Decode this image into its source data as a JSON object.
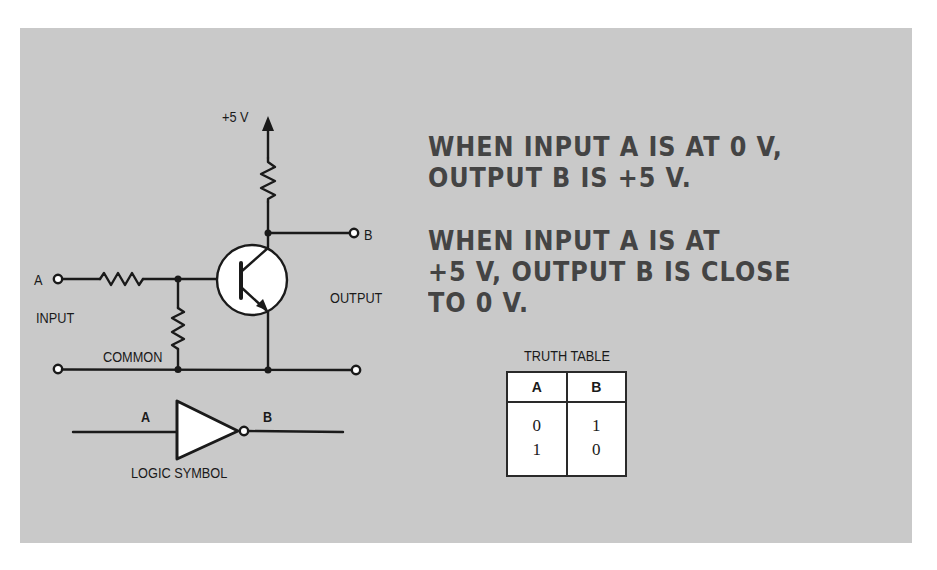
{
  "circuit": {
    "supply_label": "+5 V",
    "input_terminal_label": "A",
    "input_label": "INPUT",
    "output_terminal_label": "B",
    "output_label": "OUTPUT",
    "common_label": "COMMON"
  },
  "logic_symbol": {
    "input_label": "A",
    "output_label": "B",
    "caption": "LOGIC SYMBOL"
  },
  "notes": {
    "paragraph_1": "WHEN INPUT A IS AT 0 V,\nOUTPUT B IS +5 V.",
    "paragraph_2": "WHEN INPUT A IS AT\n+5 V, OUTPUT B IS CLOSE\nTO 0 V."
  },
  "truth_table": {
    "title": "TRUTH TABLE",
    "headers": [
      "A",
      "B"
    ],
    "rows": [
      [
        "0",
        "1"
      ],
      [
        "1",
        "0"
      ]
    ]
  },
  "colors": {
    "panel_bg": "#c9c9c9",
    "ink": "#1a1a1a",
    "handwriting": "#444444",
    "component_fill": "#ffffff"
  }
}
